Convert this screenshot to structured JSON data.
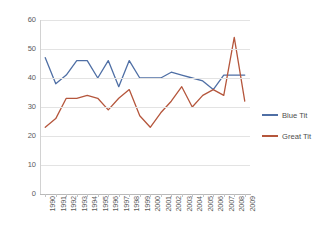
{
  "chart_data": {
    "type": "line",
    "title": "",
    "xlabel": "",
    "ylabel": "",
    "ylim": [
      0,
      60
    ],
    "ytick_step": 10,
    "yticks": [
      "0",
      "10",
      "20",
      "30",
      "40",
      "50",
      "60"
    ],
    "grid": true,
    "legend_position": "right",
    "categories": [
      "1990",
      "1991",
      "1992",
      "1993",
      "1994",
      "1995",
      "1996",
      "1997",
      "1998",
      "1999",
      "2000",
      "2001",
      "2002",
      "2003",
      "2004",
      "2005",
      "2006",
      "2007",
      "2008",
      "2009"
    ],
    "series": [
      {
        "name": "Blue Tit",
        "color": "#4f6fa5",
        "values": [
          47,
          38,
          41,
          46,
          46,
          40,
          46,
          37,
          46,
          40,
          40,
          40,
          42,
          41,
          40,
          39,
          36,
          41,
          41,
          41
        ]
      },
      {
        "name": "Great Tit",
        "color": "#b5563c",
        "values": [
          23,
          26,
          33,
          33,
          34,
          33,
          29,
          33,
          36,
          27,
          23,
          28,
          32,
          37,
          30,
          34,
          36,
          34,
          54,
          32
        ]
      }
    ]
  },
  "legend": {
    "items": [
      {
        "label": "Blue Tit",
        "color": "#4f6fa5"
      },
      {
        "label": "Great Tit",
        "color": "#b5563c"
      }
    ]
  }
}
